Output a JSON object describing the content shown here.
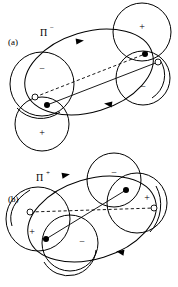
{
  "figure": {
    "background_color": "#ffffff",
    "line_color": "#000000",
    "width": 178,
    "height": 287
  },
  "panels": [
    {
      "id": "a",
      "label": "(a)",
      "label_x": 8,
      "label_y": 45,
      "symbol": {
        "base": "Π",
        "superscript": "−",
        "text": "Π−",
        "x": 40,
        "y": 36
      },
      "orbit": {
        "type": "ellipse",
        "cx": 89,
        "cy": 72,
        "rx": 66,
        "ry": 40,
        "rotation_deg": -17,
        "arrow_directions": [
          "clockwise-top-right",
          "counterclockwise-bottom-left"
        ]
      },
      "circles": [
        {
          "name": "top-right-plus",
          "sign": "+",
          "cx": 142,
          "cy": 32,
          "r": 29,
          "sign_dx": 0,
          "sign_dy": -4
        },
        {
          "name": "right-minus",
          "sign": "−",
          "cx": 143,
          "cy": 78,
          "r": 27,
          "sign_dx": 0,
          "sign_dy": 10
        },
        {
          "name": "left-minus",
          "sign": "−",
          "cx": 42,
          "cy": 84,
          "r": 32,
          "sign_dx": 0,
          "sign_dy": -14
        },
        {
          "name": "bottom-left-plus",
          "sign": "+",
          "cx": 42,
          "cy": 124,
          "r": 27,
          "sign_dx": 0,
          "sign_dy": 10
        }
      ],
      "markers": [
        {
          "name": "filled-dot-left",
          "type": "filled",
          "cx": 47,
          "cy": 105,
          "r": 3.0
        },
        {
          "name": "open-dot-left",
          "type": "open",
          "cx": 35,
          "cy": 97,
          "r": 3.0
        },
        {
          "name": "filled-dot-right",
          "type": "filled",
          "cx": 145,
          "cy": 54,
          "r": 3.0
        },
        {
          "name": "open-dot-right",
          "type": "open",
          "cx": 158,
          "cy": 62,
          "r": 3.0
        }
      ],
      "connectors": [
        {
          "name": "solid-axis",
          "style": "solid",
          "x1": 47,
          "y1": 105,
          "x2": 158,
          "y2": 62
        },
        {
          "name": "dipole-axis",
          "style": "dashed",
          "x1": 35,
          "y1": 97,
          "x2": 145,
          "y2": 54
        }
      ]
    },
    {
      "id": "b",
      "label": "(b)",
      "label_x": 8,
      "label_y": 202,
      "symbol": {
        "base": "Π",
        "superscript": "+",
        "text": "Π+",
        "x": 36,
        "y": 181
      },
      "orbit": {
        "type": "ellipse",
        "cx": 92,
        "cy": 219,
        "rx": 66,
        "ry": 40,
        "rotation_deg": -17,
        "arrow_directions": [
          "clockwise-top-left",
          "counterclockwise-bottom-right"
        ]
      },
      "circles": [
        {
          "name": "top-right-minus",
          "sign": "−",
          "cx": 114,
          "cy": 180,
          "r": 27,
          "sign_dx": 0,
          "sign_dy": -6
        },
        {
          "name": "right-plus",
          "sign": "+",
          "cx": 137,
          "cy": 203,
          "r": 30,
          "sign_dx": 10,
          "sign_dy": -4
        },
        {
          "name": "left-plus",
          "sign": "+",
          "cx": 38,
          "cy": 219,
          "r": 32,
          "sign_dx": -6,
          "sign_dy": 14
        },
        {
          "name": "bottom-minus",
          "sign": "−",
          "cx": 70,
          "cy": 243,
          "r": 28,
          "sign_dx": 12,
          "sign_dy": 0
        }
      ],
      "markers": [
        {
          "name": "open-dot-left",
          "type": "open",
          "cx": 30,
          "cy": 212,
          "r": 3.0
        },
        {
          "name": "filled-dot-left",
          "type": "filled",
          "cx": 46,
          "cy": 239,
          "r": 3.0
        },
        {
          "name": "filled-dot-right",
          "type": "filled",
          "cx": 126,
          "cy": 190,
          "r": 3.0
        },
        {
          "name": "open-dot-right",
          "type": "open",
          "cx": 154,
          "cy": 208,
          "r": 3.0
        }
      ],
      "connectors": [
        {
          "name": "solid-axis",
          "style": "solid",
          "x1": 46,
          "y1": 239,
          "x2": 126,
          "y2": 190
        },
        {
          "name": "dipole-axis",
          "style": "dashed",
          "x1": 30,
          "y1": 212,
          "x2": 154,
          "y2": 208
        }
      ]
    }
  ]
}
